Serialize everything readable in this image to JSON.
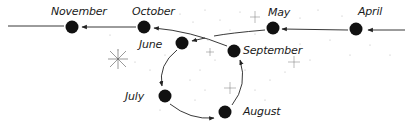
{
  "diagram": {
    "type": "retrograde-motion",
    "line_color": "#222222",
    "dot_color": "#111111",
    "speck_color": "#b5b5b5",
    "positions": [
      {
        "id": "april",
        "label": "April",
        "x": 356,
        "y": 29,
        "label_x": 358,
        "label_y": 7
      },
      {
        "id": "may",
        "label": "May",
        "x": 273,
        "y": 28,
        "label_x": 268,
        "label_y": 8
      },
      {
        "id": "june",
        "label": "June",
        "x": 182,
        "y": 42,
        "label_x": 139,
        "label_y": 40
      },
      {
        "id": "july",
        "label": "July",
        "x": 165,
        "y": 96,
        "label_x": 125,
        "label_y": 91
      },
      {
        "id": "august",
        "label": "August",
        "x": 225,
        "y": 112,
        "label_x": 243,
        "label_y": 106
      },
      {
        "id": "september",
        "label": "September",
        "x": 234,
        "y": 51,
        "label_x": 243,
        "label_y": 46
      },
      {
        "id": "october",
        "label": "October",
        "x": 144,
        "y": 27,
        "label_x": 132,
        "label_y": 6
      },
      {
        "id": "november",
        "label": "November",
        "x": 72,
        "y": 27,
        "label_x": 51,
        "label_y": 6
      }
    ]
  }
}
